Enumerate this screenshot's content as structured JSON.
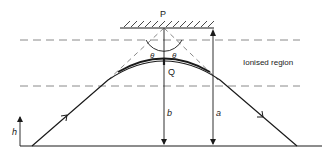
{
  "diagram": {
    "labels": {
      "point_p": "P",
      "point_q": "Q",
      "theta_left": "θ",
      "theta_right": "θ",
      "height_h": "h",
      "distance_b": "b",
      "distance_a": "a",
      "region": "Ionised region"
    },
    "colors": {
      "line": "#1a1a1a",
      "dashed": "#8a8a8a"
    }
  }
}
